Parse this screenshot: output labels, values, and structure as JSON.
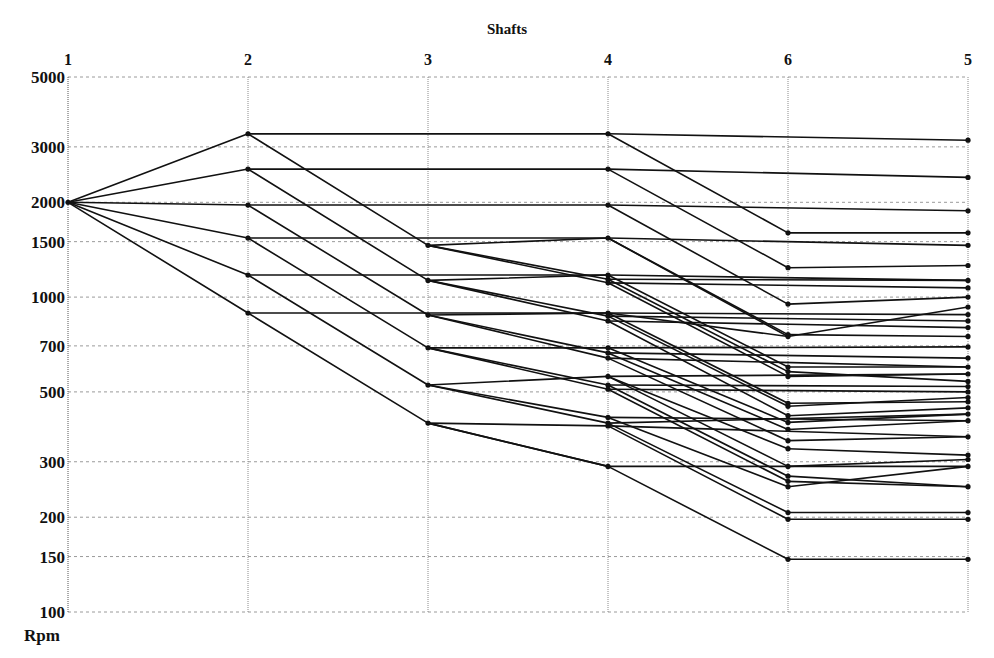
{
  "chart_data": {
    "type": "line",
    "title": "Shafts",
    "xlabel": "Shafts",
    "ylabel": "Rpm",
    "yscale": "log",
    "ylim": [
      100,
      5000
    ],
    "grid": true,
    "legend": "none",
    "x_categories": [
      "1",
      "2",
      "3",
      "4",
      "6",
      "5"
    ],
    "y_ticks": [
      5000,
      3000,
      2000,
      1500,
      1000,
      700,
      500,
      300,
      200,
      150,
      100
    ],
    "shaft_speeds": {
      "1": [
        2000
      ],
      "2": [
        3300,
        2550,
        1960,
        1540,
        1175,
        890
      ],
      "3": [
        1460,
        1130,
        877,
        690,
        526,
        398
      ],
      "4": [
        3300,
        2550,
        1960,
        1540,
        1175,
        1140,
        1110,
        890,
        870,
        840,
        690,
        665,
        640,
        560,
        526,
        510,
        415,
        398,
        390,
        290
      ],
      "6": [
        1600,
        1240,
        950,
        760,
        750,
        600,
        580,
        560,
        460,
        450,
        420,
        400,
        380,
        350,
        330,
        290,
        270,
        260,
        250,
        207,
        197,
        147
      ],
      "5": [
        3150,
        2400,
        1880,
        1600,
        1460,
        1260,
        1130,
        1070,
        1000,
        930,
        880,
        840,
        800,
        750,
        695,
        640,
        600,
        570,
        540,
        520,
        500,
        480,
        465,
        445,
        425,
        405,
        360,
        315,
        305,
        290,
        250,
        207,
        197,
        147
      ]
    },
    "segments": [
      [
        1,
        2000,
        2,
        3300
      ],
      [
        1,
        2000,
        2,
        2550
      ],
      [
        1,
        2000,
        2,
        1960
      ],
      [
        1,
        2000,
        2,
        1540
      ],
      [
        1,
        2000,
        2,
        1175
      ],
      [
        1,
        2000,
        2,
        890
      ],
      [
        2,
        3300,
        4,
        3300
      ],
      [
        2,
        2550,
        4,
        2550
      ],
      [
        2,
        1960,
        4,
        1960
      ],
      [
        2,
        1540,
        4,
        1540
      ],
      [
        2,
        1175,
        4,
        1175
      ],
      [
        2,
        890,
        4,
        890
      ],
      [
        2,
        3300,
        3,
        1460
      ],
      [
        2,
        2550,
        3,
        1130
      ],
      [
        2,
        1960,
        3,
        877
      ],
      [
        2,
        1540,
        3,
        690
      ],
      [
        2,
        1175,
        3,
        526
      ],
      [
        2,
        890,
        3,
        398
      ],
      [
        3,
        1460,
        4,
        1540
      ],
      [
        3,
        1460,
        4,
        1140
      ],
      [
        3,
        1460,
        4,
        1110
      ],
      [
        3,
        1130,
        4,
        1175
      ],
      [
        3,
        1130,
        4,
        870
      ],
      [
        3,
        1130,
        4,
        840
      ],
      [
        3,
        877,
        4,
        890
      ],
      [
        3,
        877,
        4,
        665
      ],
      [
        3,
        877,
        4,
        640
      ],
      [
        3,
        690,
        4,
        690
      ],
      [
        3,
        690,
        4,
        526
      ],
      [
        3,
        690,
        4,
        510
      ],
      [
        3,
        526,
        4,
        560
      ],
      [
        3,
        526,
        4,
        415
      ],
      [
        3,
        526,
        4,
        398
      ],
      [
        3,
        398,
        4,
        390
      ],
      [
        3,
        398,
        4,
        290
      ],
      [
        3,
        398,
        4,
        290
      ],
      [
        4,
        3300,
        5,
        3150
      ],
      [
        4,
        2550,
        5,
        2400
      ],
      [
        4,
        1960,
        5,
        1880
      ],
      [
        4,
        1540,
        5,
        1460
      ],
      [
        4,
        1175,
        5,
        1130
      ],
      [
        4,
        1140,
        5,
        1130
      ],
      [
        4,
        1110,
        5,
        1070
      ],
      [
        4,
        890,
        5,
        880
      ],
      [
        4,
        870,
        5,
        840
      ],
      [
        4,
        840,
        5,
        800
      ],
      [
        4,
        690,
        5,
        695
      ],
      [
        4,
        665,
        5,
        640
      ],
      [
        4,
        640,
        5,
        600
      ],
      [
        4,
        560,
        5,
        570
      ],
      [
        4,
        526,
        5,
        520
      ],
      [
        4,
        510,
        5,
        500
      ],
      [
        4,
        415,
        5,
        405
      ],
      [
        4,
        398,
        5,
        425
      ],
      [
        4,
        390,
        5,
        360
      ],
      [
        4,
        290,
        5,
        290
      ],
      [
        4,
        3300,
        6,
        1600
      ],
      [
        4,
        2550,
        6,
        1240
      ],
      [
        4,
        1960,
        6,
        950
      ],
      [
        4,
        1540,
        6,
        760
      ],
      [
        4,
        1175,
        6,
        600
      ],
      [
        4,
        1140,
        6,
        580
      ],
      [
        4,
        1110,
        6,
        560
      ],
      [
        4,
        890,
        6,
        460
      ],
      [
        4,
        870,
        6,
        450
      ],
      [
        4,
        840,
        6,
        420
      ],
      [
        4,
        690,
        6,
        400
      ],
      [
        4,
        665,
        6,
        380
      ],
      [
        4,
        640,
        6,
        350
      ],
      [
        4,
        560,
        6,
        330
      ],
      [
        4,
        526,
        6,
        270
      ],
      [
        4,
        510,
        6,
        260
      ],
      [
        4,
        415,
        6,
        250
      ],
      [
        4,
        398,
        6,
        207
      ],
      [
        4,
        390,
        6,
        197
      ],
      [
        4,
        290,
        6,
        147
      ],
      [
        4,
        1540,
        6,
        750
      ],
      [
        4,
        890,
        6,
        750
      ],
      [
        4,
        560,
        6,
        290
      ],
      [
        6,
        1600,
        5,
        1600
      ],
      [
        6,
        1240,
        5,
        1260
      ],
      [
        6,
        950,
        5,
        1000
      ],
      [
        6,
        760,
        5,
        750
      ],
      [
        6,
        750,
        5,
        930
      ],
      [
        6,
        600,
        5,
        600
      ],
      [
        6,
        580,
        5,
        540
      ],
      [
        6,
        560,
        5,
        570
      ],
      [
        6,
        460,
        5,
        465
      ],
      [
        6,
        450,
        5,
        480
      ],
      [
        6,
        420,
        5,
        445
      ],
      [
        6,
        400,
        5,
        425
      ],
      [
        6,
        380,
        5,
        405
      ],
      [
        6,
        350,
        5,
        360
      ],
      [
        6,
        330,
        5,
        315
      ],
      [
        6,
        290,
        5,
        305
      ],
      [
        6,
        270,
        5,
        250
      ],
      [
        6,
        260,
        5,
        250
      ],
      [
        6,
        250,
        5,
        290
      ],
      [
        6,
        207,
        5,
        207
      ],
      [
        6,
        197,
        5,
        197
      ],
      [
        6,
        147,
        5,
        147
      ]
    ]
  }
}
